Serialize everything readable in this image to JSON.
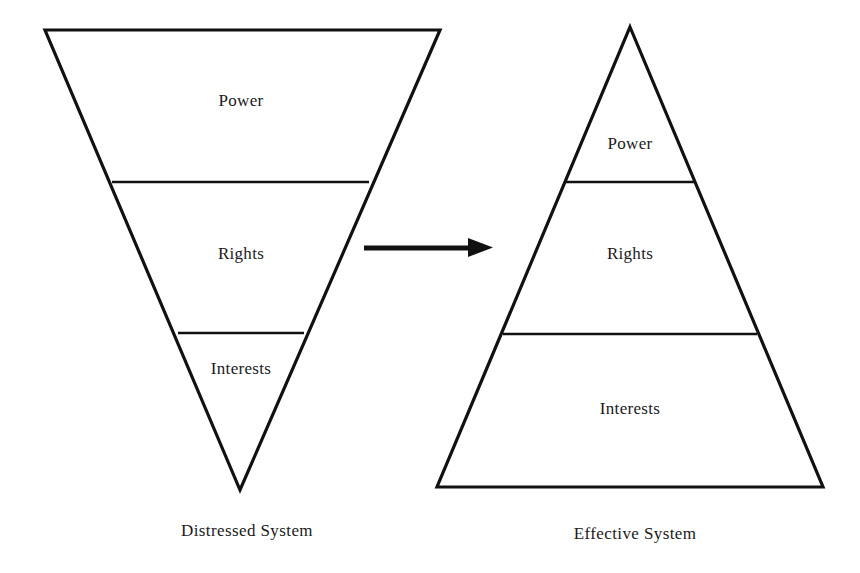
{
  "figure": {
    "background_color": "#ffffff",
    "line_color": "#111111",
    "text_color": "#1a1a1a",
    "width": 860,
    "height": 573
  },
  "diagram_data": {
    "type": "diagram",
    "subtype": "paired-triangle-tier-comparison",
    "description": "Two stacked-tier triangles comparing dispute resolution systems: an inverted triangle (distressed system, Power largest at top) transformed by an arrow into an upright pyramid (effective system, Interests largest at base).",
    "tier_names": [
      "Power",
      "Rights",
      "Interests"
    ],
    "shapes": [
      {
        "id": "distressed",
        "orientation": "inverted-triangle",
        "caption": "Distressed System",
        "tiers": [
          {
            "label": "Power",
            "position": "top",
            "relative_area": "largest"
          },
          {
            "label": "Rights",
            "position": "middle",
            "relative_area": "medium"
          },
          {
            "label": "Interests",
            "position": "bottom",
            "relative_area": "smallest"
          }
        ]
      },
      {
        "id": "effective",
        "orientation": "upright-triangle",
        "caption": "Effective System",
        "tiers": [
          {
            "label": "Power",
            "position": "top",
            "relative_area": "smallest"
          },
          {
            "label": "Rights",
            "position": "middle",
            "relative_area": "medium"
          },
          {
            "label": "Interests",
            "position": "bottom",
            "relative_area": "largest"
          }
        ]
      }
    ],
    "connector": {
      "type": "arrow",
      "direction": "left-to-right",
      "label": ""
    }
  },
  "left_shape": {
    "caption": "Distressed System",
    "tier_top": "Power",
    "tier_middle": "Rights",
    "tier_bottom": "Interests"
  },
  "right_shape": {
    "caption": "Effective System",
    "tier_top": "Power",
    "tier_middle": "Rights",
    "tier_bottom": "Interests"
  },
  "connector": {
    "name": "transformation-arrow"
  }
}
